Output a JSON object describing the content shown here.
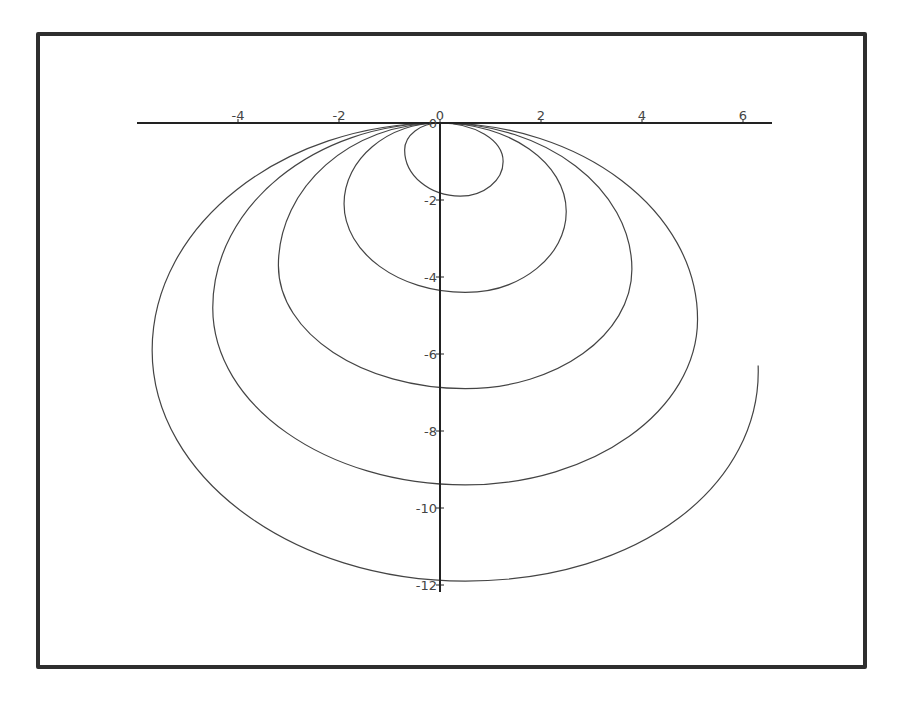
{
  "chart_data": {
    "type": "line",
    "title": "",
    "xlabel": "",
    "ylabel": "",
    "xlim": [
      -5.9,
      6.5
    ],
    "ylim": [
      -12.2,
      0.2
    ],
    "grid": false,
    "legend": null,
    "x_ticks": [
      -4,
      -2,
      0,
      2,
      4,
      6
    ],
    "y_ticks": [
      -2,
      -4,
      -6,
      -8,
      -10,
      -12
    ],
    "x_tick_labels": [
      "-4",
      "-2",
      "0",
      "2",
      "4",
      "6"
    ],
    "y_tick_labels": [
      "-2",
      "-4",
      "-6",
      "-8",
      "-10",
      "-12"
    ],
    "origin_label": "0",
    "series": [
      {
        "name": "parametric spiral",
        "description": "Single continuous curve forming nested loops, all tangent to the x-axis at the origin, opening downward; final outer loop ends at about (6.3, -6.4)",
        "loops": [
          {
            "left": [
              -0.7,
              -0.7
            ],
            "right": [
              1.25,
              -1.0
            ],
            "bottom": [
              0.4,
              -1.9
            ]
          },
          {
            "left": [
              -1.9,
              -2.1
            ],
            "right": [
              2.5,
              -2.3
            ],
            "bottom": [
              0.5,
              -4.4
            ]
          },
          {
            "left": [
              -3.2,
              -3.7
            ],
            "right": [
              3.8,
              -3.8
            ],
            "bottom": [
              0.5,
              -6.9
            ]
          },
          {
            "left": [
              -4.5,
              -4.8
            ],
            "right": [
              5.1,
              -5.1
            ],
            "bottom": [
              0.5,
              -9.4
            ]
          },
          {
            "left": [
              -5.7,
              -5.9
            ],
            "bottom": [
              0.5,
              -11.9
            ],
            "end": [
              6.3,
              -6.3
            ]
          }
        ]
      }
    ]
  },
  "axes": {
    "origin_px": [
      440,
      123
    ],
    "px_per_unit_x": 50.5,
    "px_per_unit_y": 38.5,
    "x_axis_px": [
      137,
      772
    ],
    "y_axis_px": [
      123,
      592
    ]
  },
  "colors": {
    "frame": "#2e2e2e",
    "axis": "#222222",
    "curve": "#444444",
    "background": "#ffffff"
  }
}
